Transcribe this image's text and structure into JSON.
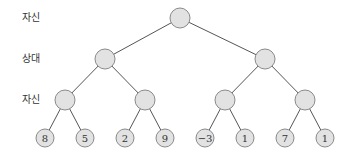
{
  "diagram": {
    "type": "minimax-game-tree",
    "level_labels": [
      {
        "text": "자신",
        "y": 12
      },
      {
        "text": "상대",
        "y": 53
      },
      {
        "text": "자신",
        "y": 94
      }
    ],
    "colors": {
      "node_fill": "#e2e2e2",
      "node_stroke": "#8a8a8a",
      "edge": "#555555"
    },
    "nodes": {
      "root": {
        "x": 180,
        "y": 18
      },
      "level1": [
        {
          "x": 105,
          "y": 59
        },
        {
          "x": 265,
          "y": 59
        }
      ],
      "level2": [
        {
          "x": 65,
          "y": 100
        },
        {
          "x": 145,
          "y": 100
        },
        {
          "x": 225,
          "y": 100
        },
        {
          "x": 305,
          "y": 100
        }
      ],
      "leaves": [
        {
          "x": 45,
          "y": 138,
          "value": "8"
        },
        {
          "x": 85,
          "y": 138,
          "value": "5"
        },
        {
          "x": 125,
          "y": 138,
          "value": "2"
        },
        {
          "x": 165,
          "y": 138,
          "value": "9"
        },
        {
          "x": 205,
          "y": 138,
          "value": "−3"
        },
        {
          "x": 245,
          "y": 138,
          "value": "1"
        },
        {
          "x": 285,
          "y": 138,
          "value": "7"
        },
        {
          "x": 325,
          "y": 138,
          "value": "1"
        }
      ]
    }
  }
}
